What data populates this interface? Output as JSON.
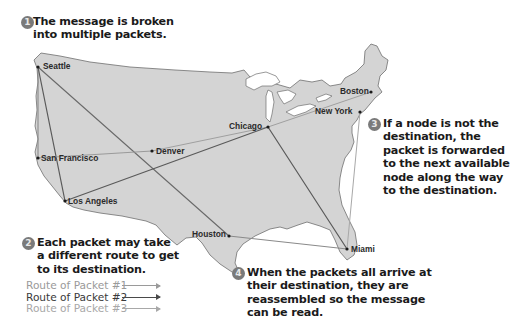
{
  "callouts": [
    {
      "step": "1",
      "lines": [
        "The message is broken",
        "into multiple packets."
      ]
    },
    {
      "step": "2",
      "lines": [
        "Each packet may take",
        "a different route to get",
        "to its destination."
      ]
    },
    {
      "step": "3",
      "lines": [
        "If a node is not the",
        "destination, the",
        "packet is forwarded",
        "to the next available",
        "node along the way",
        "to the destination."
      ]
    },
    {
      "step": "4",
      "lines": [
        "When the packets all arrive at",
        "their destination, they are",
        "reassembled so the message",
        "can be read."
      ]
    }
  ],
  "cities": [
    {
      "name": "Seattle"
    },
    {
      "name": "San Francisco"
    },
    {
      "name": "Los Angeles"
    },
    {
      "name": "Denver"
    },
    {
      "name": "Chicago"
    },
    {
      "name": "Boston"
    },
    {
      "name": "New York"
    },
    {
      "name": "Houston"
    },
    {
      "name": "Miami"
    }
  ],
  "legend": [
    {
      "label": "Route of Packet #1",
      "color": "#9a9a9a"
    },
    {
      "label": "Route of Packet #2",
      "color": "#4a4a4a"
    },
    {
      "label": "Route of Packet #3",
      "color": "#a8a8a8"
    }
  ],
  "colors": {
    "land": "#d4d4d4",
    "outline": "#6e6e6e",
    "badge": "#7a7a7a"
  }
}
